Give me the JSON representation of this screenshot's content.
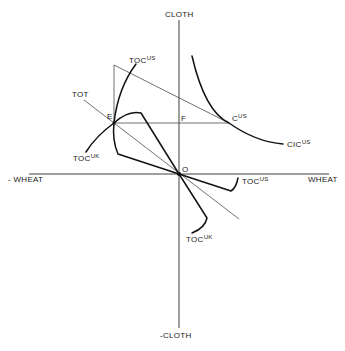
{
  "diagram": {
    "axes": {
      "y_pos": "CLOTH",
      "y_neg": "-CLOTH",
      "x_pos": "WHEAT",
      "x_neg": "- WHEAT"
    },
    "points": {
      "origin": "O",
      "E": "E",
      "F": "F",
      "C_us_base": "C",
      "C_us_sup": "US"
    },
    "curves": {
      "toc_us_upper_base": "TOC",
      "toc_us_upper_sup": "US",
      "toc_uk_upper_base": "TOC",
      "toc_uk_upper_sup": "UK",
      "toc_us_lower_base": "TOC",
      "toc_us_lower_sup": "US",
      "toc_uk_lower_base": "TOC",
      "toc_uk_lower_sup": "UK",
      "tot": "TOT",
      "cic_base": "CIC",
      "cic_sup": "US"
    },
    "colors": {
      "ink": "#111111",
      "background": "#ffffff"
    }
  }
}
